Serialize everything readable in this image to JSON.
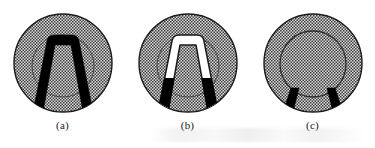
{
  "figure": {
    "background_color": "#ffffff",
    "line_color": "#1b1b1b",
    "fill_color": "#000000",
    "hatch_color": "#4a4a4a",
    "hatch_background": "#d8d8d8",
    "panel_count": 3,
    "panels": [
      {
        "id": "a",
        "caption": "(a)",
        "outer_circle": {
          "cx": 63,
          "cy": 63,
          "r": 49
        },
        "inner_circle": {
          "cx": 63,
          "cy": 66,
          "r": 31
        },
        "shape_name": "full-black-tapered-u",
        "shape_description": "solid black inverted-U with arched top inside inner circle and legs splaying to the outer circle bottom",
        "u_shape": {
          "fill": "#000000",
          "outline": "none",
          "top_y": 35,
          "bottom_y": 110,
          "top_half_width": 16,
          "bottom_half_width": 30,
          "band_thickness": 5,
          "corner_radius": 5
        }
      },
      {
        "id": "b",
        "caption": "(b)",
        "outer_circle": {
          "cx": 63,
          "cy": 63,
          "r": 49
        },
        "inner_circle": {
          "cx": 63,
          "cy": 66,
          "r": 31
        },
        "shape_name": "white-outlined-u-with-black-feet",
        "shape_description": "inverted-U band drawn white with thin black outline in the upper portion, turning solid black on the lower legs",
        "u_shape": {
          "fill": "#ffffff",
          "outline": "#1b1b1b",
          "top_y": 35,
          "bottom_y": 110,
          "top_half_width": 16,
          "bottom_half_width": 30,
          "band_thickness": 5,
          "corner_radius": 5,
          "black_foot_start_y": 78
        }
      },
      {
        "id": "c",
        "caption": "(c)",
        "outer_circle": {
          "cx": 63,
          "cy": 63,
          "r": 49
        },
        "inner_circle": {
          "cx": 63,
          "cy": 64,
          "r": 33
        },
        "shape_name": "two-black-feet-only",
        "shape_description": "only the two short solid black legs remain near the bottom of the inner circle, the U arch is absent",
        "u_shape": {
          "fill": "#000000",
          "outline": "none",
          "top_y": 88,
          "bottom_y": 110,
          "top_half_width": 22,
          "bottom_half_width": 30,
          "band_thickness": 5,
          "corner_radius": 0
        }
      }
    ]
  }
}
